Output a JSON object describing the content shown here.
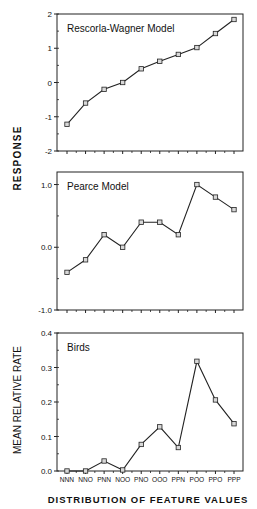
{
  "chart_data": [
    {
      "type": "line",
      "title": "Rescorla-Wagner Model",
      "xlabel": "DISTRIBUTION OF FEATURE VALUES",
      "ylabel": "RESPONSE",
      "categories": [
        "NNN",
        "NNO",
        "PNN",
        "NOO",
        "PNO",
        "OOO",
        "PPN",
        "POO",
        "PPO",
        "PPP"
      ],
      "values": [
        -1.22,
        -0.6,
        -0.2,
        0.0,
        0.4,
        0.62,
        0.82,
        1.02,
        1.43,
        1.84
      ],
      "ylim": [
        -2,
        2
      ],
      "yticks": [
        "2",
        "1",
        "0",
        "-1",
        "-2"
      ],
      "marker": "square",
      "grid": false
    },
    {
      "type": "line",
      "title": "Pearce Model",
      "xlabel": "DISTRIBUTION OF FEATURE VALUES",
      "ylabel": "RESPONSE",
      "categories": [
        "NNN",
        "NNO",
        "PNN",
        "NOO",
        "PNO",
        "OOO",
        "PPN",
        "POO",
        "PPO",
        "PPP"
      ],
      "values": [
        -0.4,
        -0.2,
        0.2,
        0.0,
        0.4,
        0.4,
        0.2,
        1.0,
        0.8,
        0.6
      ],
      "ylim": [
        -1.0,
        1.2
      ],
      "yticks": [
        "1.0",
        "0.0",
        "-1.0"
      ],
      "marker": "square",
      "grid": false
    },
    {
      "type": "line",
      "title": "Birds",
      "xlabel": "DISTRIBUTION OF FEATURE VALUES",
      "ylabel": "MEAN RELATIVE RATE",
      "categories": [
        "NNN",
        "NNO",
        "PNN",
        "NOO",
        "PNO",
        "OOO",
        "PPN",
        "POO",
        "PPO",
        "PPP"
      ],
      "values": [
        0.0,
        0.0,
        0.029,
        0.003,
        0.077,
        0.128,
        0.068,
        0.318,
        0.206,
        0.137
      ],
      "ylim": [
        0.0,
        0.4
      ],
      "yticks": [
        "0.4",
        "0.3",
        "0.2",
        "0.1",
        "0.0"
      ],
      "marker": "square",
      "grid": false
    }
  ],
  "labels": {
    "shared_ylabel_top": "RESPONSE",
    "ylabel_bottom": "MEAN RELATIVE RATE",
    "xtitle": "DISTRIBUTION OF FEATURE VALUES"
  },
  "layout": {
    "plot_left": 57,
    "plot_right": 243,
    "x_first": 67,
    "x_last": 234,
    "panels": [
      {
        "top": 14,
        "bottom": 151,
        "ymin": -2,
        "ymax": 2,
        "tick_values": [
          2,
          1,
          0,
          -1,
          -2
        ],
        "minor_step": 0.5
      },
      {
        "top": 172,
        "bottom": 310,
        "ymin": -1.0,
        "ymax": 1.2,
        "tick_values": [
          1.0,
          0.0,
          -1.0
        ],
        "minor_step": 0.5
      },
      {
        "top": 333,
        "bottom": 471,
        "ymin": 0.0,
        "ymax": 0.4,
        "tick_values": [
          0.4,
          0.3,
          0.2,
          0.1,
          0.0
        ],
        "minor_step": 0.05
      }
    ]
  },
  "colors": {
    "line": "#222222",
    "axis": "#222222",
    "marker_fill": "#d8d8d8",
    "background": "#ffffff"
  }
}
